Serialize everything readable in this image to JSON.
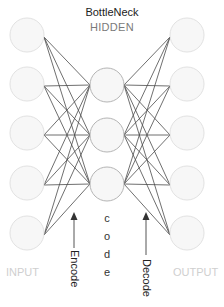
{
  "title": "BottleNeck",
  "subtitle": "HIDDEN",
  "labels": {
    "input": "INPUT",
    "output": "OUTPUT",
    "encode": "Encode",
    "decode": "Decode",
    "code_letters": [
      "c",
      "o",
      "d",
      "e"
    ]
  },
  "colors": {
    "io_stroke": "#e2e2e2",
    "io_fill": "#f7f7f7",
    "hidden_stroke": "#b5b5b5",
    "hidden_fill": "#f7f7f7",
    "edge": "#4a4a4a",
    "arrow": "#333333"
  },
  "network": {
    "radius": 17,
    "input_layer": {
      "cx": 27,
      "cy": [
        35,
        84,
        133,
        183,
        233
      ]
    },
    "hidden_layer": {
      "cx": 107,
      "cy": [
        85,
        135,
        184
      ]
    },
    "output_layer": {
      "cx": 187,
      "cy": [
        35,
        84,
        133,
        183,
        233
      ]
    }
  }
}
